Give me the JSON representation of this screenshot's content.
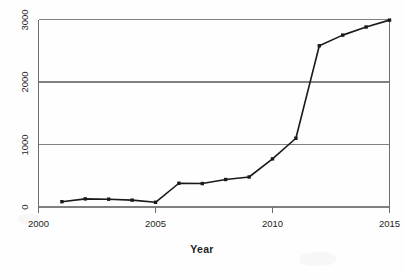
{
  "chart_data": {
    "type": "line",
    "title": "",
    "subtitle": "",
    "xlabel": "Year",
    "ylabel": "",
    "x": [
      2001,
      2002,
      2003,
      2004,
      2005,
      2006,
      2007,
      2008,
      2009,
      2010,
      2011,
      2012,
      2013,
      2014,
      2015
    ],
    "values": [
      85,
      130,
      125,
      110,
      75,
      380,
      375,
      440,
      480,
      770,
      1100,
      2580,
      2750,
      2880,
      2990
    ],
    "series": [
      {
        "name": "",
        "values": [
          85,
          130,
          125,
          110,
          75,
          380,
          375,
          440,
          480,
          770,
          1100,
          2580,
          2750,
          2880,
          2990
        ]
      }
    ],
    "xlim": [
      2000,
      2015
    ],
    "ylim": [
      0,
      3000
    ],
    "xticks": [
      2000,
      2005,
      2010,
      2015
    ],
    "xtick_labels": [
      "2000",
      "2005",
      "2010",
      "2015"
    ],
    "yticks": [
      0,
      1000,
      2000,
      3000
    ],
    "ytick_labels": [
      "0",
      "1000",
      "2000",
      "3000"
    ],
    "grid": "horizontal",
    "legend": "none",
    "marker": "square",
    "line_color": "#1a1a1a",
    "marker_color": "#1a1a1a",
    "grid_color": "#808080",
    "axis_color": "#6e6e6e",
    "background": "#ffffff",
    "ytick_rotation": 90,
    "annotations": []
  }
}
